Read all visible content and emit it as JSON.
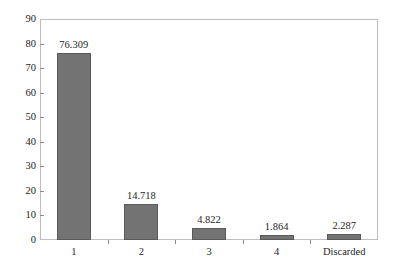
{
  "chart_data": {
    "type": "bar",
    "title": "",
    "subtitle": "",
    "xlabel": "",
    "ylabel": "",
    "categories": [
      "1",
      "2",
      "3",
      "4",
      "Discarded"
    ],
    "values": [
      76.309,
      14.718,
      4.822,
      1.864,
      2.287
    ],
    "value_labels": [
      "76.309",
      "14.718",
      "4.822",
      "1.864",
      "2.287"
    ],
    "ylim": [
      0,
      90
    ],
    "y_ticks": [
      0,
      10,
      20,
      30,
      40,
      50,
      60,
      70,
      80,
      90
    ],
    "y_tick_labels": [
      "0",
      "10",
      "20",
      "30",
      "40",
      "50",
      "60",
      "70",
      "80",
      "90"
    ],
    "grid": false,
    "legend": null,
    "legend_position": "none",
    "bar_color": "#737373",
    "bar_edge_color": "#5a5a5a",
    "frame_color": "#bdbdbd",
    "background_color": "#ffffff",
    "text_color": "#1f1f1f"
  }
}
